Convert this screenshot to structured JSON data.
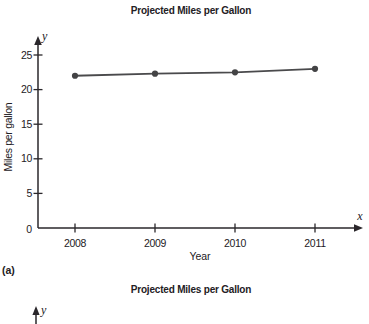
{
  "page": {
    "background": "#ffffff"
  },
  "figure_a": {
    "label": "(a)"
  },
  "figure_b": {
    "title": "Projected Miles per Gallon",
    "y_axis_letter": "y"
  },
  "chart_data": [
    {
      "type": "line",
      "title": "Projected Miles per Gallon",
      "xlabel": "Year",
      "ylabel": "Miles per gallon",
      "x_axis_letter": "x",
      "y_axis_letter": "y",
      "origin_label": "0",
      "categories": [
        "2008",
        "2009",
        "2010",
        "2011"
      ],
      "series": [
        {
          "name": "Projected miles per gallon",
          "values": [
            22,
            22.3,
            22.5,
            23
          ]
        }
      ],
      "ylim": [
        0,
        25
      ],
      "yticks": [
        5,
        10,
        15,
        20,
        25
      ],
      "grid": false,
      "legend": false,
      "line_color": "#4a4a4c",
      "point_color": "#434345",
      "axis_color": "#2a272b"
    },
    {
      "type": "line",
      "title": "Projected Miles per Gallon",
      "y_axis_letter": "y",
      "visible_portion": "title and y-axis arrow only (figure cropped at bottom edge)"
    }
  ]
}
